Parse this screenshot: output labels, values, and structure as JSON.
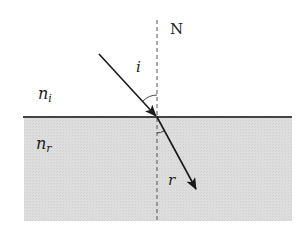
{
  "diagram": {
    "type": "refraction",
    "labels": {
      "normal": "N",
      "incidence_angle": "i",
      "refraction_angle": "r",
      "upper_medium_base": "n",
      "upper_medium_sub": "i",
      "lower_medium_base": "n",
      "lower_medium_sub": "r"
    },
    "colors": {
      "lower_medium_fill": "#dcdcdc",
      "interface_line": "#444444",
      "ray": "#1a1a1a",
      "normal_line": "#555555",
      "text": "#222222"
    }
  }
}
